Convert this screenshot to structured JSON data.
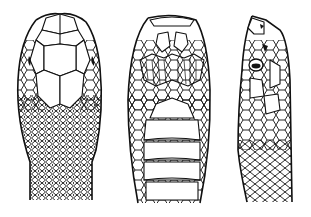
{
  "figure": {
    "background": "#ffffff",
    "ink": "#111111",
    "panels": [
      {
        "id": "dorsal",
        "view": "top view of head"
      },
      {
        "id": "ventral",
        "view": "underside view of head"
      },
      {
        "id": "lateral",
        "view": "side view of head"
      }
    ]
  }
}
